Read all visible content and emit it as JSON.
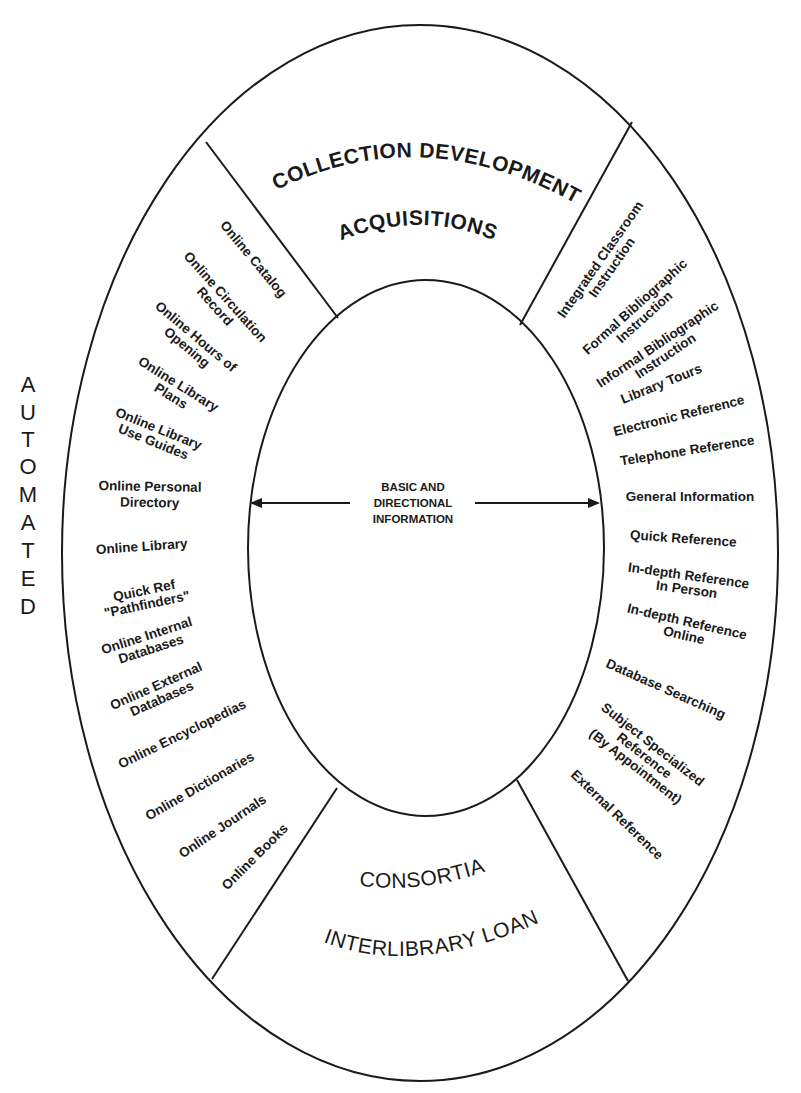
{
  "diagram": {
    "side_label": "AUTOMATED",
    "side_letters": [
      "A",
      "U",
      "T",
      "O",
      "M",
      "A",
      "T",
      "E",
      "D"
    ],
    "center": {
      "lines": [
        "BASIC AND",
        "DIRECTIONAL",
        "INFORMATION"
      ],
      "arrows": "bidirectional-horizontal"
    },
    "top_segment": {
      "title": "COLLECTION DEVELOPMENT",
      "subtitle": "ACQUISITIONS"
    },
    "bottom_segment": {
      "title": "CONSORTIA",
      "subtitle": "INTERLIBRARY LOAN"
    },
    "left_segment": {
      "items": [
        {
          "lines": [
            "Online Catalog"
          ]
        },
        {
          "lines": [
            "Online Circulation",
            "Record"
          ]
        },
        {
          "lines": [
            "Online Hours of",
            "Opening"
          ]
        },
        {
          "lines": [
            "Online Library",
            "Plans"
          ]
        },
        {
          "lines": [
            "Online Library",
            "Use Guides"
          ]
        },
        {
          "lines": [
            "Online Personal",
            "Directory"
          ]
        },
        {
          "lines": [
            "Online Library"
          ]
        },
        {
          "lines": [
            "Quick Ref",
            "\"Pathfinders\""
          ]
        },
        {
          "lines": [
            "Online Internal",
            "Databases"
          ]
        },
        {
          "lines": [
            "Online External",
            "Databases"
          ]
        },
        {
          "lines": [
            "Online Encyclopedias"
          ]
        },
        {
          "lines": [
            "Online Dictionaries"
          ]
        },
        {
          "lines": [
            "Online Journals"
          ]
        },
        {
          "lines": [
            "Online Books"
          ]
        }
      ]
    },
    "right_segment": {
      "items": [
        {
          "lines": [
            "Integrated Classroom",
            "Instruction"
          ]
        },
        {
          "lines": [
            "Formal Bibliographic",
            "Instruction"
          ]
        },
        {
          "lines": [
            "Informal Bibliographic",
            "Instruction"
          ]
        },
        {
          "lines": [
            "Library Tours"
          ]
        },
        {
          "lines": [
            "Electronic Reference"
          ]
        },
        {
          "lines": [
            "Telephone Reference"
          ]
        },
        {
          "lines": [
            "General Information"
          ]
        },
        {
          "lines": [
            "Quick Reference"
          ]
        },
        {
          "lines": [
            "In-depth Reference",
            "In Person"
          ]
        },
        {
          "lines": [
            "In-depth Reference",
            "Online"
          ]
        },
        {
          "lines": [
            "Database Searching"
          ]
        },
        {
          "lines": [
            "Subject Specialized",
            "Reference",
            "(By Appointment)"
          ]
        },
        {
          "lines": [
            "External Reference"
          ]
        }
      ]
    },
    "colors": {
      "line": "#1a1a1a",
      "background": "#ffffff"
    }
  }
}
